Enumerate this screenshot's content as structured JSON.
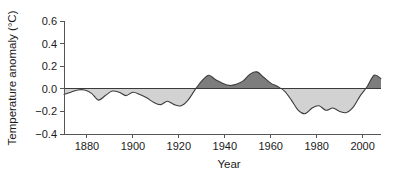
{
  "chart_data": {
    "type": "area",
    "title": "",
    "xlabel": "Year",
    "ylabel": "Temperature anomaly (°C)",
    "xlim": [
      1870,
      2008
    ],
    "ylim": [
      -0.4,
      0.6
    ],
    "xticks": [
      1880,
      1900,
      1920,
      1940,
      1960,
      1980,
      2000
    ],
    "xtick_labels": [
      "1880",
      "1900",
      "1920",
      "1940",
      "1960",
      "1980",
      "2000"
    ],
    "yticks": [
      -0.4,
      -0.2,
      0.0,
      0.2,
      0.4,
      0.6
    ],
    "ytick_labels": [
      "-0.4",
      "-0.2",
      "0.0",
      "0.2",
      "0.4",
      "0.6"
    ],
    "grid": false,
    "legend": "none",
    "baseline": 0.0,
    "fill_positive_color": "#7d7d7d",
    "fill_negative_color": "#d2d2d2",
    "line_color": "#3c3c3c",
    "axis_color": "#555555",
    "series": [
      {
        "name": "Temperature anomaly",
        "x": [
          1870,
          1873,
          1876,
          1879,
          1882,
          1885,
          1888,
          1891,
          1894,
          1897,
          1900,
          1903,
          1906,
          1909,
          1912,
          1915,
          1918,
          1921,
          1924,
          1927,
          1930,
          1933,
          1936,
          1939,
          1942,
          1945,
          1948,
          1951,
          1954,
          1957,
          1960,
          1963,
          1966,
          1969,
          1972,
          1975,
          1978,
          1981,
          1984,
          1987,
          1990,
          1993,
          1996,
          1999,
          2002,
          2005,
          2008
        ],
        "values": [
          -0.05,
          -0.03,
          -0.01,
          -0.01,
          -0.04,
          -0.1,
          -0.06,
          -0.02,
          -0.03,
          -0.06,
          -0.03,
          -0.05,
          -0.08,
          -0.12,
          -0.14,
          -0.11,
          -0.14,
          -0.15,
          -0.1,
          -0.01,
          0.07,
          0.12,
          0.08,
          0.05,
          0.03,
          0.04,
          0.07,
          0.13,
          0.15,
          0.1,
          0.05,
          0.02,
          -0.02,
          -0.1,
          -0.19,
          -0.22,
          -0.17,
          -0.15,
          -0.19,
          -0.17,
          -0.2,
          -0.21,
          -0.16,
          -0.06,
          0.02,
          0.12,
          0.09
        ]
      }
    ]
  },
  "labels": {
    "y_axis_title": "Temperature anomaly (°C)",
    "x_axis_title": "Year"
  }
}
